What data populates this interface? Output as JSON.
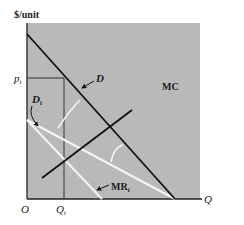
{
  "figure": {
    "type": "economics-diagram",
    "y_axis_label": "$/unit",
    "x_axis_label": "Q",
    "origin_label": "O",
    "price_label": "p",
    "price_subscript": "t",
    "quantity_label": "Q",
    "quantity_subscript": "t",
    "curves": [
      {
        "name": "D",
        "label": "D",
        "color": "#111111",
        "style": "solid"
      },
      {
        "name": "MC",
        "label": "MC",
        "color": "#111111",
        "style": "solid"
      },
      {
        "name": "D_t",
        "label": "D",
        "subscript": "t",
        "color": "#ffffff",
        "style": "solid"
      },
      {
        "name": "MR_t",
        "label": "MR",
        "subscript": "t",
        "color": "#ffffff",
        "style": "solid"
      }
    ],
    "colors": {
      "plot_background": "#b9b9b9",
      "axis": "#222222",
      "dark_curve": "#111111",
      "light_curve": "#f5f5f5"
    }
  }
}
